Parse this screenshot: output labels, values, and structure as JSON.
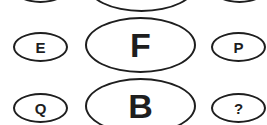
{
  "puzzle": {
    "rows": [
      {
        "left": {
          "label": ""
        },
        "center": {
          "label": ""
        },
        "right": {
          "label": ""
        }
      },
      {
        "left": {
          "label": "E"
        },
        "center": {
          "label": "F"
        },
        "right": {
          "label": "P"
        }
      },
      {
        "left": {
          "label": "Q"
        },
        "center": {
          "label": "B"
        },
        "right": {
          "label": "?"
        }
      }
    ]
  },
  "colors": {
    "stroke": "#1e1e1e",
    "background": "#ffffff"
  }
}
